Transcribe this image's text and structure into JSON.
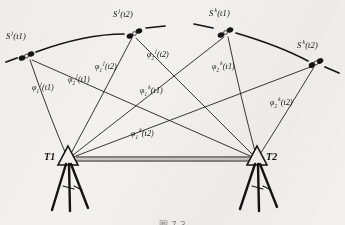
{
  "figure": {
    "caption": "图 7-3",
    "background_color": "#f2f1ee",
    "ink_color": "#111111"
  },
  "stations": [
    {
      "id": "T1",
      "label": "T1",
      "x": 68,
      "y": 159,
      "label_x": 44,
      "label_y": 152
    },
    {
      "id": "T2",
      "label": "T2",
      "x": 257,
      "y": 159,
      "label_x": 266,
      "label_y": 152
    }
  ],
  "baseline": {
    "from": "T1",
    "to": "T2",
    "style": "double-line"
  },
  "satellites": [
    {
      "id": "sj_t1",
      "sat": "S",
      "sup": "j",
      "time": "t1",
      "label": "S j(t1)",
      "x": 27,
      "y": 56,
      "label_x": 6,
      "label_y": 32
    },
    {
      "id": "sj_t2",
      "sat": "S",
      "sup": "j",
      "time": "t2",
      "label": "S j(t2)",
      "x": 134,
      "y": 33,
      "label_x": 113,
      "label_y": 10
    },
    {
      "id": "sk_t1",
      "sat": "S",
      "sup": "k",
      "time": "t1",
      "label": "S k(t1)",
      "x": 225,
      "y": 32,
      "label_x": 209,
      "label_y": 9
    },
    {
      "id": "sk_t2",
      "sat": "S",
      "sup": "k",
      "time": "t2",
      "label": "S k(t2)",
      "x": 316,
      "y": 62,
      "label_x": 297,
      "label_y": 41
    }
  ],
  "observations": [
    {
      "id": "phi1_j_t1",
      "phi": "φ",
      "sub": "1",
      "sup": "j",
      "time": "t1",
      "from": "T1",
      "to": "sj_t1",
      "label_x": 32,
      "label_y": 84
    },
    {
      "id": "phi2_j_t1",
      "phi": "φ",
      "sub": "2",
      "sup": "j",
      "time": "t1",
      "from": "T2",
      "to": "sj_t1",
      "label_x": 68,
      "label_y": 76
    },
    {
      "id": "phi1_j_t2",
      "phi": "φ",
      "sub": "1",
      "sup": "j",
      "time": "t2",
      "from": "T1",
      "to": "sj_t2",
      "label_x": 95,
      "label_y": 63
    },
    {
      "id": "phi2_j_t2",
      "phi": "φ",
      "sub": "2",
      "sup": "j",
      "time": "t2",
      "from": "T2",
      "to": "sj_t2",
      "label_x": 147,
      "label_y": 51
    },
    {
      "id": "phi1_k_t1",
      "phi": "φ",
      "sub": "1",
      "sup": "k",
      "time": "t1",
      "from": "T1",
      "to": "sk_t1",
      "label_x": 140,
      "label_y": 87
    },
    {
      "id": "phi2_k_t1",
      "phi": "φ",
      "sub": "2",
      "sup": "k",
      "time": "t1",
      "from": "T2",
      "to": "sk_t1",
      "label_x": 212,
      "label_y": 63
    },
    {
      "id": "phi1_k_t2",
      "phi": "φ",
      "sub": "1",
      "sup": "k",
      "time": "t2",
      "from": "T1",
      "to": "sk_t2",
      "label_x": 131,
      "label_y": 130
    },
    {
      "id": "phi2_k_t2",
      "phi": "φ",
      "sub": "2",
      "sup": "k",
      "time": "t2",
      "from": "T2",
      "to": "sk_t2",
      "label_x": 270,
      "label_y": 99
    }
  ]
}
